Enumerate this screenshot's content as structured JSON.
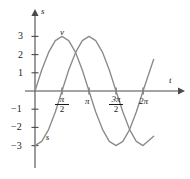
{
  "chart_data": {
    "type": "line",
    "title": "",
    "xlabel": "t",
    "ylabel": "s",
    "xlim": [
      0,
      7.33
    ],
    "ylim": [
      -3.6,
      3.6
    ],
    "grid": false,
    "legend": "inline-curve-labels",
    "x_ticks": [
      {
        "value": 1.5708,
        "label": "pi/2",
        "numerator": "π",
        "denominator": "2"
      },
      {
        "value": 3.14159,
        "label": "π",
        "numerator": "π",
        "denominator": ""
      },
      {
        "value": 4.71239,
        "label": "3pi/2",
        "numerator": "3π",
        "denominator": "2"
      },
      {
        "value": 6.28319,
        "label": "2π",
        "numerator": "2π",
        "denominator": ""
      }
    ],
    "y_ticks": [
      {
        "value": 3,
        "label": "3"
      },
      {
        "value": 2,
        "label": "2"
      },
      {
        "value": 1,
        "label": "1"
      },
      {
        "value": -1,
        "label": "−1"
      },
      {
        "value": -2,
        "label": "−2"
      },
      {
        "value": -3,
        "label": "−3"
      }
    ],
    "series": [
      {
        "name": "v",
        "equation": "v = 3 sin(t)",
        "color": "#8a8a8a",
        "label_text": "v",
        "amplitude": 3,
        "phase": 0,
        "x_start": 0,
        "x_end": 6.9,
        "points": [
          {
            "t": 0.0,
            "y": 0.0
          },
          {
            "t": 0.39,
            "y": 1.15
          },
          {
            "t": 0.79,
            "y": 2.12
          },
          {
            "t": 1.18,
            "y": 2.77
          },
          {
            "t": 1.57,
            "y": 3.0
          },
          {
            "t": 1.96,
            "y": 2.77
          },
          {
            "t": 2.36,
            "y": 2.12
          },
          {
            "t": 2.75,
            "y": 1.15
          },
          {
            "t": 3.14,
            "y": 0.0
          },
          {
            "t": 3.53,
            "y": -1.15
          },
          {
            "t": 3.93,
            "y": -2.12
          },
          {
            "t": 4.32,
            "y": -2.77
          },
          {
            "t": 4.71,
            "y": -3.0
          },
          {
            "t": 5.11,
            "y": -2.77
          },
          {
            "t": 5.5,
            "y": -2.12
          },
          {
            "t": 5.89,
            "y": -1.15
          },
          {
            "t": 6.28,
            "y": 0.0
          },
          {
            "t": 6.9,
            "y": 1.74
          }
        ]
      },
      {
        "name": "s",
        "equation": "s = −3 cos(t)",
        "color": "#8a8a8a",
        "label_text": "s",
        "amplitude": 3,
        "phase": -1.5708,
        "x_start": 0,
        "x_end": 6.9,
        "points": [
          {
            "t": 0.0,
            "y": -3.0
          },
          {
            "t": 0.39,
            "y": -2.77
          },
          {
            "t": 0.79,
            "y": -2.12
          },
          {
            "t": 1.18,
            "y": -1.15
          },
          {
            "t": 1.57,
            "y": 0.0
          },
          {
            "t": 1.96,
            "y": 1.15
          },
          {
            "t": 2.36,
            "y": 2.12
          },
          {
            "t": 2.75,
            "y": 2.77
          },
          {
            "t": 3.14,
            "y": 3.0
          },
          {
            "t": 3.53,
            "y": 2.77
          },
          {
            "t": 3.93,
            "y": 2.12
          },
          {
            "t": 4.32,
            "y": 1.15
          },
          {
            "t": 4.71,
            "y": 0.0
          },
          {
            "t": 5.11,
            "y": -1.15
          },
          {
            "t": 5.5,
            "y": -2.12
          },
          {
            "t": 5.89,
            "y": -2.77
          },
          {
            "t": 6.28,
            "y": -3.0
          },
          {
            "t": 6.9,
            "y": -2.48
          }
        ]
      }
    ],
    "annotations": [
      {
        "name": "curve-label-v",
        "text": "v",
        "t": 1.45,
        "y": 3.45
      },
      {
        "name": "curve-label-s",
        "text": "s",
        "t": 0.62,
        "y": -2.3
      }
    ],
    "axis_labels": {
      "x": "t",
      "y": "s"
    },
    "axis_color": "#4a4a4a"
  }
}
